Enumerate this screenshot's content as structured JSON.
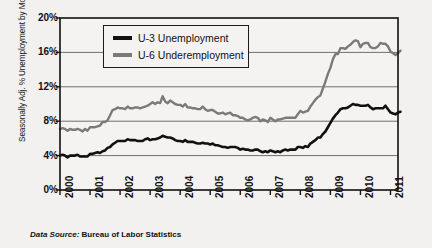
{
  "chart_data": {
    "type": "line",
    "title": "",
    "subtitle": "",
    "xlabel": "",
    "ylabel": "Seasonally Adj. % Unemployment by Month",
    "source_note_prefix": "Data Source:",
    "source_note": "Bureau of Labor Statistics",
    "xlim": [
      2000.0,
      2011.25
    ],
    "ylim": [
      0,
      20
    ],
    "yticks": [
      "0%",
      "4%",
      "8%",
      "12%",
      "16%",
      "20%"
    ],
    "ytick_values": [
      0,
      4,
      8,
      12,
      16,
      20
    ],
    "xticks": [
      "2000",
      "2001",
      "2002",
      "2003",
      "2004",
      "2005",
      "2006",
      "2007",
      "2008",
      "2009",
      "2010",
      "2011"
    ],
    "xtick_values": [
      2000,
      2001,
      2002,
      2003,
      2004,
      2005,
      2006,
      2007,
      2008,
      2009,
      2010,
      2011
    ],
    "grid": "horizontal",
    "legend_position": "top-left-inside",
    "units": "percent",
    "series": [
      {
        "name": "U-3 Unemployment",
        "color": "#111111",
        "values": [
          4.0,
          4.1,
          4.0,
          3.8,
          4.0,
          4.0,
          4.0,
          4.1,
          3.9,
          3.9,
          3.9,
          3.9,
          4.2,
          4.2,
          4.3,
          4.4,
          4.3,
          4.5,
          4.6,
          4.9,
          5.0,
          5.3,
          5.5,
          5.7,
          5.7,
          5.7,
          5.7,
          5.9,
          5.8,
          5.8,
          5.8,
          5.7,
          5.7,
          5.7,
          5.9,
          6.0,
          5.8,
          5.9,
          5.9,
          6.0,
          6.1,
          6.3,
          6.2,
          6.1,
          6.1,
          6.0,
          5.8,
          5.7,
          5.7,
          5.6,
          5.8,
          5.6,
          5.6,
          5.6,
          5.5,
          5.4,
          5.4,
          5.5,
          5.4,
          5.4,
          5.3,
          5.4,
          5.2,
          5.2,
          5.1,
          5.0,
          5.0,
          4.9,
          5.0,
          5.0,
          5.0,
          4.9,
          4.7,
          4.8,
          4.7,
          4.7,
          4.6,
          4.6,
          4.7,
          4.7,
          4.5,
          4.4,
          4.5,
          4.4,
          4.6,
          4.5,
          4.4,
          4.5,
          4.4,
          4.6,
          4.7,
          4.6,
          4.7,
          4.7,
          4.7,
          5.0,
          5.0,
          4.9,
          5.1,
          5.0,
          5.4,
          5.6,
          5.8,
          6.1,
          6.1,
          6.5,
          6.8,
          7.3,
          7.8,
          8.3,
          8.7,
          9.0,
          9.4,
          9.5,
          9.5,
          9.6,
          9.8,
          10.0,
          9.9,
          9.9,
          9.8,
          9.8,
          9.8,
          9.9,
          9.6,
          9.4,
          9.5,
          9.5,
          9.5,
          9.5,
          9.8,
          9.4,
          9.0,
          8.9,
          8.8,
          9.0,
          9.1
        ]
      },
      {
        "name": "U-6 Underemployment",
        "color": "#7a7a7a",
        "values": [
          7.1,
          7.2,
          7.1,
          6.9,
          7.1,
          7.0,
          7.0,
          7.1,
          7.0,
          6.8,
          7.1,
          6.9,
          7.3,
          7.3,
          7.3,
          7.4,
          7.5,
          7.9,
          7.9,
          8.1,
          8.7,
          9.3,
          9.4,
          9.6,
          9.5,
          9.5,
          9.4,
          9.7,
          9.5,
          9.5,
          9.6,
          9.6,
          9.5,
          9.6,
          9.7,
          9.8,
          10.0,
          10.2,
          10.0,
          10.2,
          10.1,
          10.9,
          10.3,
          10.1,
          10.4,
          10.2,
          10.0,
          9.9,
          9.9,
          9.7,
          10.0,
          9.6,
          9.6,
          9.5,
          9.5,
          9.4,
          9.4,
          9.7,
          9.4,
          9.2,
          9.3,
          9.3,
          9.1,
          8.9,
          8.9,
          9.0,
          8.8,
          8.9,
          9.0,
          8.7,
          8.7,
          8.6,
          8.4,
          8.4,
          8.2,
          8.1,
          8.2,
          8.4,
          8.5,
          8.4,
          8.0,
          8.2,
          8.1,
          7.9,
          8.4,
          8.2,
          8.0,
          8.2,
          8.2,
          8.3,
          8.4,
          8.4,
          8.4,
          8.4,
          8.4,
          8.8,
          9.2,
          9.0,
          9.1,
          9.2,
          9.7,
          10.1,
          10.5,
          10.8,
          11.0,
          11.8,
          12.6,
          13.5,
          14.2,
          15.2,
          15.8,
          15.8,
          16.5,
          16.5,
          16.4,
          16.7,
          16.9,
          17.2,
          17.4,
          17.3,
          16.6,
          17.0,
          17.1,
          17.1,
          16.6,
          16.5,
          16.5,
          16.7,
          17.1,
          17.0,
          17.0,
          16.7,
          16.1,
          15.9,
          15.7,
          15.9,
          16.2
        ]
      }
    ],
    "annotations": {
      "start_year": 2000,
      "start_month": 1,
      "peak_u6": 17.4,
      "peak_u3": 10.0,
      "trough_u6": 7.9,
      "trough_u3": 3.8
    },
    "colors": {
      "background": "#f2f1ef",
      "plot_background": "#f4f3f1",
      "axis": "#111111",
      "grid": "#6f6f6f",
      "u3": "#111111",
      "u6": "#7a7a7a"
    }
  },
  "legend": {
    "items": [
      {
        "label": "U-3 Unemployment",
        "color": "#111111"
      },
      {
        "label": "U-6 Underemployment",
        "color": "#7a7a7a"
      }
    ]
  },
  "axis": {
    "y_title": "Seasonally Adj. % Unemployment by Month",
    "y_labels": [
      "20%",
      "16%",
      "12%",
      "8%",
      "4%",
      "0%"
    ],
    "x_labels": [
      "2000",
      "2001",
      "2002",
      "2003",
      "2004",
      "2005",
      "2006",
      "2007",
      "2008",
      "2009",
      "2010",
      "2011"
    ]
  },
  "footer": {
    "source_prefix": "Data Source:",
    "source_text": "Bureau of Labor Statistics"
  }
}
